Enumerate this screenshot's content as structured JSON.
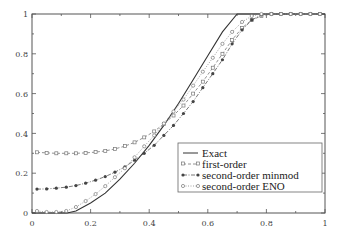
{
  "chart_data": {
    "type": "line",
    "title": "",
    "xlabel": "",
    "ylabel": "",
    "xlim": [
      0,
      1
    ],
    "ylim": [
      0,
      1
    ],
    "grid": false,
    "legend_position": "bottom-right",
    "x_ticks": [
      "0",
      "0.2",
      "0.4",
      "0.6",
      "0.8",
      "1"
    ],
    "y_ticks": [
      "0",
      "0.2",
      "0.4",
      "0.6",
      "0.8",
      "1"
    ],
    "series": [
      {
        "name": "Exact",
        "style": "solid",
        "marker": "none",
        "x": [
          0,
          0.05,
          0.1,
          0.12,
          0.15,
          0.2,
          0.25,
          0.3,
          0.35,
          0.4,
          0.45,
          0.5,
          0.55,
          0.6,
          0.65,
          0.7,
          0.75,
          0.8,
          0.9,
          1.0
        ],
        "y": [
          0,
          0,
          0,
          0,
          0.01,
          0.05,
          0.1,
          0.17,
          0.25,
          0.34,
          0.44,
          0.55,
          0.67,
          0.79,
          0.91,
          1.0,
          1.0,
          1.0,
          1.0,
          1.0
        ]
      },
      {
        "name": "first-order",
        "style": "dashed",
        "marker": "open-square",
        "x": [
          0.017,
          0.05,
          0.083,
          0.117,
          0.15,
          0.183,
          0.217,
          0.25,
          0.283,
          0.317,
          0.35,
          0.383,
          0.417,
          0.45,
          0.483,
          0.517,
          0.55,
          0.583,
          0.617,
          0.65,
          0.683,
          0.717,
          0.75,
          0.783,
          0.817,
          0.85,
          0.883,
          0.917,
          0.95,
          0.983
        ],
        "y": [
          0.305,
          0.302,
          0.3,
          0.3,
          0.3,
          0.302,
          0.306,
          0.312,
          0.322,
          0.336,
          0.355,
          0.38,
          0.41,
          0.448,
          0.49,
          0.54,
          0.6,
          0.66,
          0.73,
          0.8,
          0.87,
          0.93,
          0.97,
          0.99,
          1.0,
          1.0,
          1.0,
          1.0,
          1.0,
          1.0
        ]
      },
      {
        "name": "second-order minmod",
        "style": "dash-dot",
        "marker": "filled-circle",
        "x": [
          0.017,
          0.05,
          0.083,
          0.117,
          0.15,
          0.183,
          0.217,
          0.25,
          0.283,
          0.317,
          0.35,
          0.383,
          0.417,
          0.45,
          0.483,
          0.517,
          0.55,
          0.583,
          0.617,
          0.65,
          0.683,
          0.717,
          0.75,
          0.783,
          0.817,
          0.85,
          0.883,
          0.917,
          0.95,
          0.983
        ],
        "y": [
          0.12,
          0.121,
          0.125,
          0.13,
          0.138,
          0.15,
          0.165,
          0.183,
          0.205,
          0.232,
          0.265,
          0.3,
          0.34,
          0.39,
          0.44,
          0.5,
          0.56,
          0.63,
          0.7,
          0.77,
          0.85,
          0.92,
          0.97,
          0.995,
          1.0,
          1.0,
          1.0,
          1.0,
          1.0,
          1.0
        ]
      },
      {
        "name": "second-order ENO",
        "style": "dotted",
        "marker": "open-circle",
        "x": [
          0.017,
          0.05,
          0.083,
          0.117,
          0.15,
          0.183,
          0.217,
          0.25,
          0.283,
          0.317,
          0.35,
          0.383,
          0.417,
          0.45,
          0.483,
          0.517,
          0.55,
          0.583,
          0.617,
          0.65,
          0.683,
          0.717,
          0.75,
          0.783,
          0.817,
          0.85,
          0.883,
          0.917,
          0.95,
          0.983
        ],
        "y": [
          0.01,
          0.005,
          0.005,
          0.01,
          0.03,
          0.06,
          0.095,
          0.135,
          0.18,
          0.225,
          0.28,
          0.335,
          0.39,
          0.45,
          0.51,
          0.57,
          0.64,
          0.71,
          0.78,
          0.85,
          0.91,
          0.96,
          0.99,
          1.0,
          1.0,
          1.0,
          1.0,
          1.0,
          1.0,
          1.0
        ]
      }
    ]
  },
  "legend": {
    "items": [
      "Exact",
      "first-order",
      "second-order minmod",
      "second-order ENO"
    ]
  }
}
